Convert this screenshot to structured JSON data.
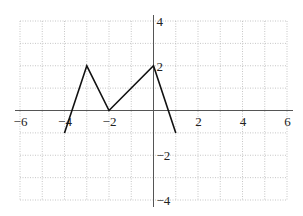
{
  "chart_data": {
    "type": "line",
    "title": "",
    "xlabel": "",
    "ylabel": "",
    "xlim": [
      -6,
      6
    ],
    "ylim": [
      -4,
      4
    ],
    "grid": true,
    "grid_step": 1,
    "x_ticks": [
      -6,
      -4,
      -2,
      2,
      4,
      6
    ],
    "x_tick_labels": [
      "−6",
      "−4",
      "−2",
      "2",
      "4",
      "6"
    ],
    "y_ticks": [
      4,
      2,
      -2,
      -4
    ],
    "y_tick_labels": [
      "4",
      "2",
      "−2",
      "−4"
    ],
    "series": [
      {
        "name": "f",
        "x": [
          -4,
          -3,
          -2,
          0,
          1
        ],
        "y": [
          -1,
          2,
          0,
          2,
          -1
        ]
      }
    ],
    "colors": {
      "line": "#111111",
      "axis": "#555555",
      "grid": "#b8b8b8"
    }
  }
}
